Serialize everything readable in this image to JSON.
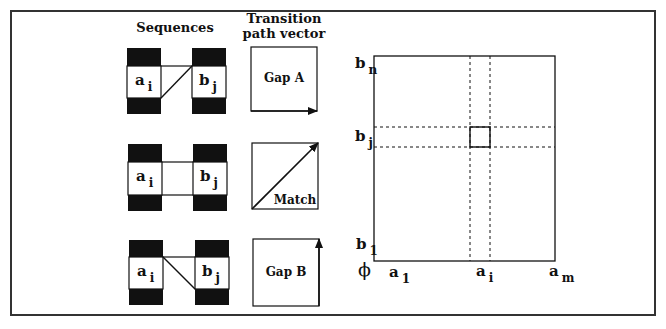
{
  "headings": {
    "sequences": "Sequences",
    "transition_line1": "Transition",
    "transition_line2": "path vector"
  },
  "rows": [
    {
      "name": "gap-a",
      "seq_a": {
        "base": "a",
        "sub": "i"
      },
      "seq_b": {
        "base": "b",
        "sub": "j"
      },
      "vector_label": "Gap A",
      "vector_direction": "horizontal"
    },
    {
      "name": "match",
      "seq_a": {
        "base": "a",
        "sub": "i"
      },
      "seq_b": {
        "base": "b",
        "sub": "j"
      },
      "vector_label": "Match",
      "vector_direction": "diagonal"
    },
    {
      "name": "gap-b",
      "seq_a": {
        "base": "a",
        "sub": "i"
      },
      "seq_b": {
        "base": "b",
        "sub": "j"
      },
      "vector_label": "Gap B",
      "vector_direction": "vertical"
    }
  ],
  "matrix": {
    "y_labels": [
      {
        "base": "b",
        "sub": "n"
      },
      {
        "base": "b",
        "sub": "j"
      },
      {
        "base": "b",
        "sub": "1"
      }
    ],
    "x_labels": [
      {
        "base": "a",
        "sub": "1"
      },
      {
        "base": "a",
        "sub": "i"
      },
      {
        "base": "a",
        "sub": "m"
      }
    ],
    "origin_label": "ϕ"
  }
}
